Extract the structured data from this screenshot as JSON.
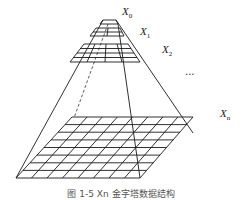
{
  "diagram": {
    "levels": [
      {
        "label": "X",
        "sub": "0",
        "grid": "1x1"
      },
      {
        "label": "X",
        "sub": "1",
        "grid": "2x2"
      },
      {
        "label": "X",
        "sub": "2",
        "grid": "4x4"
      },
      {
        "label": "X",
        "sub": "n",
        "grid": "8x8"
      }
    ],
    "ellipsis": "...",
    "caption": "图 1-5  Xn 金字塔数据结构"
  },
  "colors": {
    "stroke": "#1a1a1a",
    "background": "#ffffff"
  }
}
